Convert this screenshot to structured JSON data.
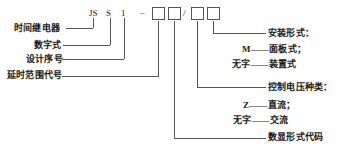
{
  "diagram": {
    "type": "model-designation-breakdown",
    "line_color": "#555555",
    "text_color": "#1a1a1a"
  },
  "code": {
    "segments": [
      {
        "id": "seg-js",
        "text": "JS"
      },
      {
        "id": "seg-s",
        "text": "S"
      },
      {
        "id": "seg-1",
        "text": "1"
      }
    ],
    "dash": "–",
    "slash": "/",
    "boxes": [
      {
        "id": "box-1",
        "value": ""
      },
      {
        "id": "box-2",
        "value": ""
      },
      {
        "id": "box-3",
        "value": ""
      },
      {
        "id": "box-4",
        "value": ""
      }
    ]
  },
  "left_labels": [
    {
      "id": "label-time-relay",
      "text": "时间继电器"
    },
    {
      "id": "label-digital-type",
      "text": "数字式"
    },
    {
      "id": "label-design-no",
      "text": "设计序号"
    },
    {
      "id": "label-delay-range",
      "text": "延时范围代号"
    }
  ],
  "right_groups": [
    {
      "id": "group-mounting",
      "heading": "安装形式：",
      "options": [
        {
          "code": "M",
          "dash": "——",
          "meaning": "面板式；"
        },
        {
          "code": "无字",
          "dash": "——",
          "meaning": "装置式"
        }
      ]
    },
    {
      "id": "group-control-voltage",
      "heading": "控制电压种类：",
      "options": [
        {
          "code": "Z",
          "dash": "——",
          "meaning": "直流；"
        },
        {
          "code": "无字",
          "dash": "——",
          "meaning": "交流"
        }
      ]
    },
    {
      "id": "group-display-code",
      "heading": "数显形式代码",
      "options": []
    }
  ]
}
